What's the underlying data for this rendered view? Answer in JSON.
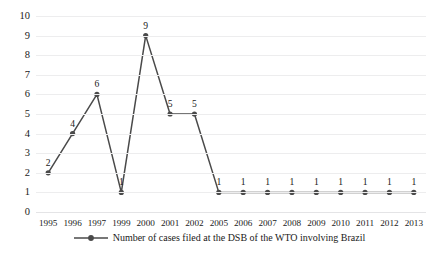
{
  "chart_data": {
    "type": "line",
    "title": "",
    "xlabel": "",
    "ylabel": "",
    "categories": [
      "1995",
      "1996",
      "1997",
      "1999",
      "2000",
      "2001",
      "2002",
      "2005",
      "2006",
      "2007",
      "2008",
      "2009",
      "2010",
      "2011",
      "2012",
      "2013"
    ],
    "values": [
      2,
      4,
      6,
      1,
      9,
      5,
      5,
      1,
      1,
      1,
      1,
      1,
      1,
      1,
      1,
      1
    ],
    "point_labels": [
      "2",
      "4",
      "6",
      "1",
      "9",
      "5",
      "5",
      "1",
      "1",
      "1",
      "1",
      "1",
      "1",
      "1",
      "1",
      "1"
    ],
    "series": [
      {
        "name": "Number of cases filed at the DSB of the WTO involving Brazil",
        "values": [
          2,
          4,
          6,
          1,
          9,
          5,
          5,
          1,
          1,
          1,
          1,
          1,
          1,
          1,
          1,
          1
        ]
      }
    ],
    "ylim": [
      0,
      10
    ],
    "y_ticks": [
      "0",
      "1",
      "2",
      "3",
      "4",
      "5",
      "6",
      "7",
      "8",
      "9",
      "10"
    ],
    "grid": true,
    "legend_position": "bottom-center",
    "series_color": "#4a4a4a",
    "gridline_color": "#ededee",
    "marker": "circle",
    "show_data_labels": true
  },
  "legend": {
    "entries": [
      {
        "label": "Number of cases filed at the DSB of the WTO involving Brazil",
        "marker": "line-marker-swatch",
        "color": "#4a4a4a"
      }
    ]
  }
}
